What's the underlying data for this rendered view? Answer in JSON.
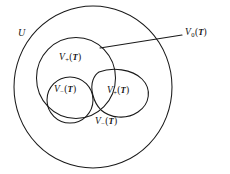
{
  "figure": {
    "type": "venn-diagram",
    "background_color": "#ffffff",
    "stroke_color": "#1a1a1a",
    "text_color": "#121212"
  },
  "labels": {
    "universe": {
      "text": "U",
      "var": "U",
      "sub": "",
      "arg": ""
    },
    "v_plus_main": {
      "text": "V+(T)",
      "var": "V",
      "sub": "+",
      "open": "(",
      "arg": "T",
      "close": ")"
    },
    "v_minus_inner": {
      "text": "V−(T)",
      "var": "V",
      "sub": "−",
      "open": "(",
      "arg": "T",
      "close": ")"
    },
    "v_plus_blob": {
      "text": "V+(T)",
      "var": "V",
      "sub": "+",
      "open": "(",
      "arg": "T",
      "close": ")"
    },
    "v_minus_outer": {
      "text": "V−(T)",
      "var": "V",
      "sub": "−",
      "open": "(",
      "arg": "T",
      "close": ")"
    },
    "v_zero": {
      "text": "V0(T)",
      "var": "V",
      "sub": "0",
      "open": "(",
      "arg": "T",
      "close": ")"
    }
  },
  "shapes": {
    "outer_ellipse": {
      "name": "universe-boundary",
      "cx": 93,
      "cy": 87,
      "rx": 79,
      "ry": 81
    },
    "inner_ellipse": {
      "name": "v-plus-region",
      "cx": 76,
      "cy": 78,
      "rx": 39.5,
      "ry": 40.5
    },
    "inner_circle": {
      "name": "v-minus-region",
      "cx": 70,
      "cy": 100,
      "r": 23
    },
    "blob": {
      "name": "v-plus-blob-region",
      "cx": 124,
      "cy": 96
    },
    "leader": {
      "name": "v-zero-leader",
      "x1": 100,
      "y1": 48,
      "x2": 182,
      "y2": 35
    }
  }
}
